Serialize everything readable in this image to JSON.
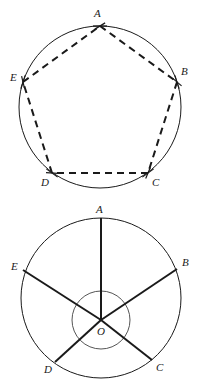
{
  "figure": {
    "title_visible": false,
    "background_color": "#ffffff",
    "stroke_color": "#1a1a1a",
    "label_color": "#1a1a1a"
  },
  "diagrams": [
    {
      "id": "inscribed-pentagon",
      "description": "Regular pentagon ABCDE inscribed in a circle, sides drawn as dashed chords with compass construction tick marks at each vertex",
      "circle": {
        "cx": 100,
        "cy": 107,
        "r": 81
      },
      "line_style": "dashed",
      "has_center_point": false,
      "vertices": [
        {
          "label": "A",
          "x": 100,
          "y": 26,
          "label_x": 94,
          "label_y": 17,
          "angle_deg": 90
        },
        {
          "label": "B",
          "x": 177,
          "y": 82,
          "label_x": 181,
          "label_y": 75,
          "angle_deg": 18
        },
        {
          "label": "C",
          "x": 148,
          "y": 173,
          "label_x": 152,
          "label_y": 186,
          "angle_deg": -54
        },
        {
          "label": "D",
          "x": 52,
          "y": 173,
          "label_x": 41,
          "label_y": 186,
          "angle_deg": -126
        },
        {
          "label": "E",
          "x": 23,
          "y": 82,
          "label_x": 10,
          "label_y": 81,
          "angle_deg": 162
        }
      ],
      "edges": [
        "AB",
        "BC",
        "CD",
        "DE",
        "EA"
      ]
    },
    {
      "id": "central-angles",
      "description": "Same circle with five radii drawn from center O to A, B, C, D, E as solid lines; a small circle around O marks the five equal central angles",
      "circle": {
        "cx": 101,
        "cy": 298,
        "r": 80
      },
      "inner_arc_circle": {
        "cx": 101,
        "cy": 320,
        "r": 29
      },
      "line_style": "solid",
      "center": {
        "label": "O",
        "x": 101,
        "y": 320,
        "label_x": 97,
        "label_y": 335
      },
      "vertices": [
        {
          "label": "A",
          "x": 101,
          "y": 218,
          "label_x": 96,
          "label_y": 213,
          "angle_deg": 90
        },
        {
          "label": "B",
          "x": 177,
          "y": 269,
          "label_x": 182,
          "label_y": 266,
          "angle_deg": 18
        },
        {
          "label": "C",
          "x": 152,
          "y": 360,
          "label_x": 156,
          "label_y": 371,
          "angle_deg": -54
        },
        {
          "label": "D",
          "x": 55,
          "y": 362,
          "label_x": 44,
          "label_y": 373,
          "angle_deg": -126
        },
        {
          "label": "E",
          "x": 23,
          "y": 270,
          "label_x": 11,
          "label_y": 270,
          "angle_deg": 162
        }
      ],
      "radii": [
        "OA",
        "OB",
        "OC",
        "OD",
        "OE"
      ],
      "central_angle_each_deg": 72
    }
  ],
  "labels": {
    "A": "A",
    "B": "B",
    "C": "C",
    "D": "D",
    "E": "E",
    "O": "O"
  }
}
